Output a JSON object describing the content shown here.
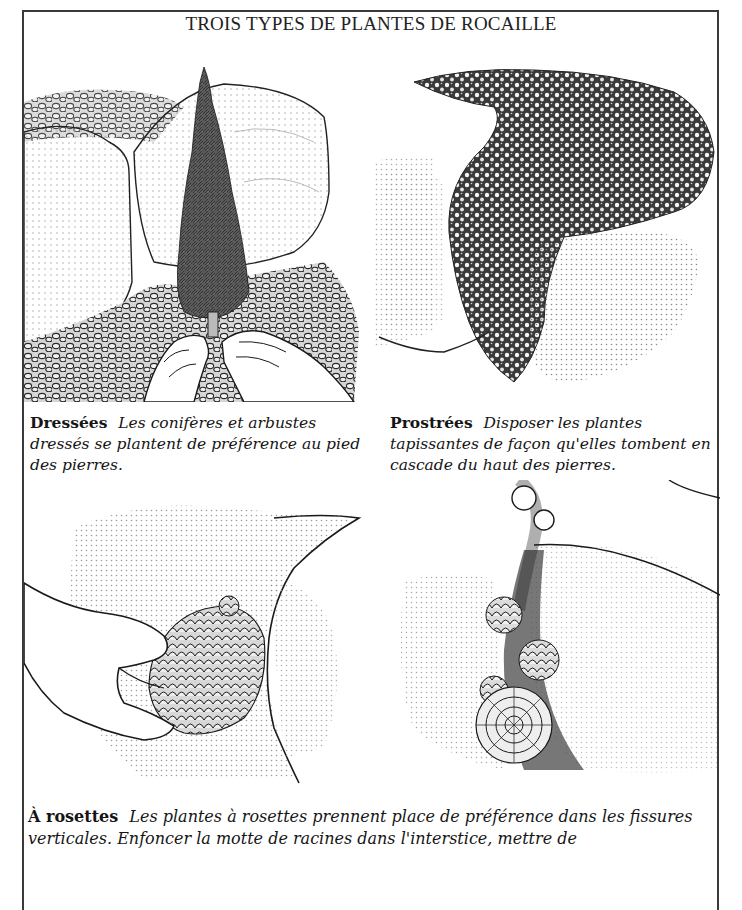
{
  "title": "TROIS TYPES DE PLANTES DE ROCAILLE",
  "panels": [
    {
      "id": "dressees",
      "illustration": "conifer-between-rocks-hands-planting",
      "caption_lead": "Dressées",
      "caption_body": "Les conifères et arbustes dressés se plantent de préférence au pied des pierres."
    },
    {
      "id": "prostrees",
      "illustration": "mat-plant-cascading-over-rocks",
      "caption_lead": "Prostrées",
      "caption_body": "Disposer les plantes tapissantes de façon qu'elles tombent en cascade du haut des pierres."
    },
    {
      "id": "rosettes-hand",
      "illustration": "hand-inserting-rosette-clump-into-crevice"
    },
    {
      "id": "rosettes-fissure",
      "illustration": "rosettes-growing-in-vertical-fissure"
    }
  ],
  "rosettes_caption": {
    "lead": "À rosettes",
    "body": "Les plantes à rosettes prennent place de préférence dans les fissures verticales. Enfoncer la motte de racines dans l'interstice, mettre de"
  },
  "colors": {
    "ink": "#1a1a1a",
    "frame": "#3a3a3a",
    "stipple": "#8a8a8a",
    "paper": "#ffffff"
  }
}
